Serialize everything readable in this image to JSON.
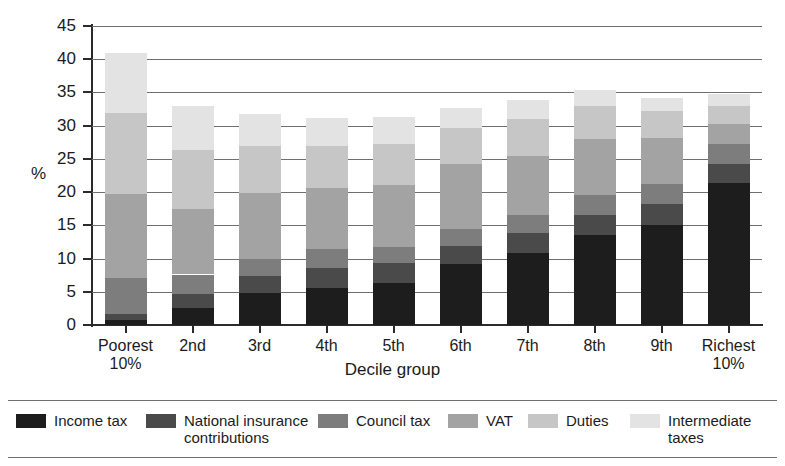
{
  "chart_data": {
    "type": "bar",
    "subtype": "stacked-bar",
    "title": "",
    "xlabel": "Decile group",
    "ylabel": "%",
    "ylim": [
      0,
      45
    ],
    "yticks": [
      0,
      5,
      10,
      15,
      20,
      25,
      30,
      35,
      40,
      45
    ],
    "grid": true,
    "legend_position": "bottom",
    "categories": [
      "Poorest 10%",
      "2nd",
      "3rd",
      "4th",
      "5th",
      "6th",
      "7th",
      "8th",
      "9th",
      "Richest 10%"
    ],
    "category_lines": [
      [
        "Poorest",
        "10%"
      ],
      [
        "2nd",
        ""
      ],
      [
        "3rd",
        ""
      ],
      [
        "4th",
        ""
      ],
      [
        "5th",
        ""
      ],
      [
        "6th",
        ""
      ],
      [
        "7th",
        ""
      ],
      [
        "8th",
        ""
      ],
      [
        "9th",
        ""
      ],
      [
        "Richest",
        "10%"
      ]
    ],
    "series": [
      {
        "name": "Income tax",
        "color": "#1d1d1d",
        "values": [
          0.8,
          2.6,
          4.8,
          5.6,
          6.3,
          9.2,
          10.8,
          13.5,
          15.0,
          21.3
        ]
      },
      {
        "name": "National insurance contributions",
        "color": "#4a4a4a",
        "values": [
          0.8,
          2.0,
          2.5,
          3.0,
          3.0,
          2.7,
          3.1,
          3.0,
          3.2,
          3.0
        ]
      },
      {
        "name": "Council tax",
        "color": "#7d7d7d",
        "values": [
          5.5,
          3.0,
          2.6,
          2.8,
          2.5,
          2.6,
          2.7,
          3.0,
          3.0,
          3.0
        ]
      },
      {
        "name": "VAT",
        "color": "#a3a3a3",
        "values": [
          12.6,
          9.9,
          9.9,
          9.2,
          9.2,
          9.7,
          8.9,
          8.5,
          7.0,
          2.9
        ]
      },
      {
        "name": "Duties",
        "color": "#c6c6c6",
        "values": [
          12.2,
          8.8,
          7.2,
          6.3,
          6.2,
          5.5,
          5.5,
          5.0,
          4.0,
          2.8
        ]
      },
      {
        "name": "Intermediate taxes",
        "color": "#e3e3e3",
        "values": [
          9.1,
          6.7,
          4.8,
          4.2,
          4.1,
          3.0,
          2.9,
          2.3,
          2.0,
          1.7
        ]
      }
    ],
    "totals": [
      41.0,
      33.0,
      31.8,
      31.1,
      31.3,
      32.7,
      33.9,
      35.3,
      34.2,
      34.7
    ]
  },
  "legend": {
    "items": [
      {
        "label": "Income tax",
        "color": "#1d1d1d"
      },
      {
        "label": "National insurance\ncontributions",
        "color": "#4a4a4a"
      },
      {
        "label": "Council tax",
        "color": "#7d7d7d"
      },
      {
        "label": "VAT",
        "color": "#a3a3a3"
      },
      {
        "label": "Duties",
        "color": "#c6c6c6"
      },
      {
        "label": "Intermediate\ntaxes",
        "color": "#e3e3e3"
      }
    ]
  },
  "colors": {
    "axis": "#2b2b2b",
    "gridline": "#6f6f6f",
    "text": "#1b1b1b",
    "background": "#ffffff"
  }
}
